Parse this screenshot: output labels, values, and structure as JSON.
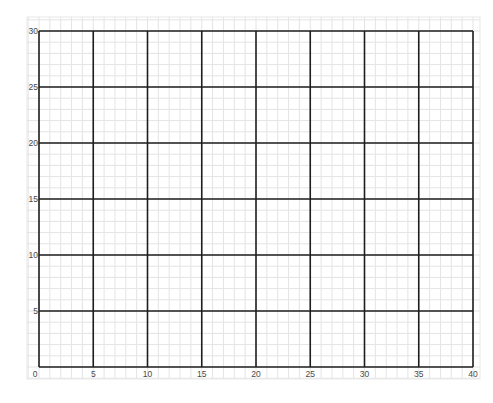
{
  "graph_paper": {
    "x_axis": {
      "min": 0,
      "max": 40,
      "major_step": 5,
      "minor_step": 1,
      "tick_labels": [
        "0",
        "5",
        "10",
        "15",
        "20",
        "25",
        "30",
        "35",
        "40"
      ]
    },
    "y_axis": {
      "min": 0,
      "max": 30,
      "major_step": 5,
      "minor_step": 1,
      "tick_labels": [
        "5",
        "10",
        "15",
        "20",
        "25",
        "30"
      ]
    },
    "origin_label": "0",
    "colors": {
      "major_line": "#1e1e1e",
      "minor_line": "#e4e4e4",
      "border": "#e8e8e8",
      "label": "#4a4a4a"
    }
  }
}
